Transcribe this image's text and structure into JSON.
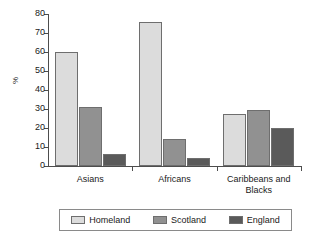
{
  "chart_data": {
    "type": "bar",
    "title": "",
    "subtitle": "",
    "xlabel": "",
    "ylabel": "%",
    "ylim": [
      0,
      80
    ],
    "ytick_step": 10,
    "yticks": [
      "80",
      "70",
      "60",
      "50",
      "40",
      "30",
      "20",
      "10",
      "0"
    ],
    "grid": false,
    "legend_position": "bottom",
    "categories": [
      "Asians",
      "Africans",
      "Caribbeans and Blacks"
    ],
    "series": [
      {
        "name": "Homeland",
        "color": "#dcdcdc",
        "values": [
          60,
          76,
          27.5
        ]
      },
      {
        "name": "Scotland",
        "color": "#919191",
        "values": [
          31,
          14,
          29.5
        ]
      },
      {
        "name": "England",
        "color": "#5a5a5a",
        "values": [
          6.5,
          4,
          20
        ]
      }
    ]
  },
  "legend": {
    "items": [
      {
        "label": "Homeland",
        "swatch": "legend-swatch-homeland"
      },
      {
        "label": "Scotland",
        "swatch": "legend-swatch-scotland"
      },
      {
        "label": "England",
        "swatch": "legend-swatch-england"
      }
    ]
  },
  "axis": {
    "y_title": "%"
  }
}
